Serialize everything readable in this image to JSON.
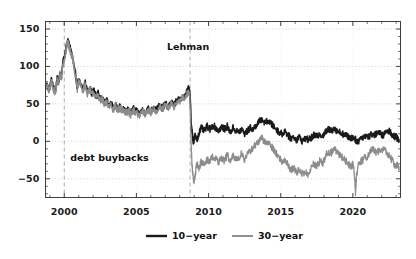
{
  "chart_data": {
    "type": "line",
    "title": "",
    "xlabel": "",
    "ylabel": "",
    "xlim": [
      1998.7,
      2023.3
    ],
    "ylim": [
      -75,
      160
    ],
    "grid": true,
    "grid_style": "dotted",
    "legend_position": "bottom-center",
    "xticks": [
      2000,
      2005,
      2010,
      2015,
      2020
    ],
    "xtick_labels": [
      "2000",
      "2005",
      "2010",
      "2015",
      "2020"
    ],
    "yticks": [
      -50,
      0,
      50,
      100,
      150
    ],
    "ytick_labels": [
      "−50",
      "0",
      "50",
      "100",
      "150"
    ],
    "annotations": [
      {
        "text": "Lehman",
        "x": 2008.72,
        "y": 132,
        "vline": true
      },
      {
        "text": "debt buybacks",
        "x": 2000.0,
        "y": -22,
        "vline": true
      }
    ],
    "series": [
      {
        "name": "10−year",
        "color": "#1a1a1a",
        "width": 1.6,
        "x": [
          1998.8,
          1998.95,
          1999.1,
          1999.25,
          1999.4,
          1999.5,
          1999.6,
          1999.7,
          1999.8,
          1999.9,
          2000.0,
          2000.08,
          2000.16,
          2000.24,
          2000.32,
          2000.4,
          2000.5,
          2000.6,
          2000.7,
          2000.8,
          2000.9,
          2001.0,
          2001.15,
          2001.3,
          2001.45,
          2001.6,
          2001.75,
          2001.9,
          2002.05,
          2002.2,
          2002.35,
          2002.5,
          2002.65,
          2002.8,
          2002.95,
          2003.1,
          2003.25,
          2003.4,
          2003.55,
          2003.7,
          2003.85,
          2004.0,
          2004.2,
          2004.4,
          2004.6,
          2004.8,
          2005.0,
          2005.2,
          2005.4,
          2005.6,
          2005.8,
          2006.0,
          2006.2,
          2006.4,
          2006.6,
          2006.8,
          2007.0,
          2007.2,
          2007.4,
          2007.6,
          2007.8,
          2008.0,
          2008.15,
          2008.3,
          2008.45,
          2008.6,
          2008.7,
          2008.75,
          2008.8,
          2008.88,
          2008.95,
          2009.05,
          2009.2,
          2009.35,
          2009.5,
          2009.7,
          2009.9,
          2010.1,
          2010.3,
          2010.5,
          2010.7,
          2010.9,
          2011.1,
          2011.3,
          2011.5,
          2011.7,
          2011.9,
          2012.1,
          2012.3,
          2012.5,
          2012.7,
          2012.9,
          2013.1,
          2013.3,
          2013.5,
          2013.7,
          2013.9,
          2014.1,
          2014.3,
          2014.5,
          2014.7,
          2014.9,
          2015.1,
          2015.3,
          2015.5,
          2015.7,
          2015.9,
          2016.1,
          2016.3,
          2016.5,
          2016.7,
          2016.9,
          2017.1,
          2017.3,
          2017.5,
          2017.7,
          2017.9,
          2018.1,
          2018.3,
          2018.5,
          2018.7,
          2018.9,
          2019.1,
          2019.3,
          2019.5,
          2019.7,
          2019.9,
          2020.05,
          2020.2,
          2020.3,
          2020.5,
          2020.7,
          2020.9,
          2021.1,
          2021.3,
          2021.5,
          2021.7,
          2021.9,
          2022.1,
          2022.3,
          2022.5,
          2022.7,
          2022.9,
          2023.0,
          2023.1,
          2023.2
        ],
        "y": [
          76,
          68,
          82,
          72,
          66,
          84,
          78,
          92,
          86,
          104,
          112,
          120,
          128,
          134,
          130,
          124,
          118,
          110,
          96,
          88,
          72,
          82,
          76,
          70,
          78,
          66,
          72,
          64,
          68,
          60,
          64,
          56,
          58,
          50,
          54,
          48,
          52,
          44,
          50,
          42,
          46,
          44,
          40,
          42,
          38,
          44,
          40,
          36,
          42,
          38,
          44,
          40,
          46,
          42,
          48,
          44,
          50,
          46,
          52,
          48,
          56,
          54,
          60,
          58,
          64,
          70,
          66,
          50,
          20,
          10,
          -4,
          8,
          2,
          12,
          18,
          14,
          20,
          16,
          22,
          18,
          14,
          20,
          16,
          20,
          12,
          18,
          14,
          12,
          16,
          10,
          14,
          18,
          16,
          22,
          26,
          30,
          24,
          28,
          24,
          20,
          16,
          12,
          10,
          14,
          8,
          4,
          6,
          2,
          6,
          0,
          4,
          2,
          4,
          8,
          6,
          10,
          8,
          12,
          16,
          14,
          18,
          14,
          12,
          10,
          8,
          6,
          4,
          6,
          2,
          -2,
          4,
          6,
          8,
          6,
          10,
          8,
          12,
          10,
          8,
          12,
          14,
          10,
          6,
          8,
          4,
          2
        ]
      },
      {
        "name": "30−year",
        "color": "#8c8c8c",
        "width": 1.3,
        "x": [
          1998.8,
          1998.95,
          1999.1,
          1999.25,
          1999.4,
          1999.5,
          1999.6,
          1999.7,
          1999.8,
          1999.9,
          2000.0,
          2000.08,
          2000.16,
          2000.24,
          2000.32,
          2000.4,
          2000.5,
          2000.6,
          2000.7,
          2000.8,
          2000.9,
          2001.0,
          2001.15,
          2001.3,
          2001.45,
          2001.6,
          2001.75,
          2001.9,
          2002.05,
          2002.2,
          2002.35,
          2002.5,
          2002.65,
          2002.8,
          2002.95,
          2003.1,
          2003.25,
          2003.4,
          2003.55,
          2003.7,
          2003.85,
          2004.0,
          2004.2,
          2004.4,
          2004.6,
          2004.8,
          2005.0,
          2005.2,
          2005.4,
          2005.6,
          2005.8,
          2006.0,
          2006.2,
          2006.4,
          2006.6,
          2006.8,
          2007.0,
          2007.2,
          2007.4,
          2007.6,
          2007.8,
          2008.0,
          2008.15,
          2008.3,
          2008.45,
          2008.6,
          2008.7,
          2008.75,
          2008.8,
          2008.85,
          2008.92,
          2009.0,
          2009.1,
          2009.2,
          2009.35,
          2009.5,
          2009.7,
          2009.9,
          2010.1,
          2010.3,
          2010.5,
          2010.7,
          2010.9,
          2011.1,
          2011.3,
          2011.5,
          2011.7,
          2011.9,
          2012.1,
          2012.3,
          2012.5,
          2012.7,
          2012.9,
          2013.1,
          2013.3,
          2013.5,
          2013.7,
          2013.9,
          2014.1,
          2014.3,
          2014.5,
          2014.7,
          2014.9,
          2015.1,
          2015.3,
          2015.5,
          2015.7,
          2015.9,
          2016.1,
          2016.3,
          2016.5,
          2016.7,
          2016.9,
          2017.1,
          2017.3,
          2017.5,
          2017.7,
          2017.9,
          2018.1,
          2018.3,
          2018.5,
          2018.7,
          2018.9,
          2019.1,
          2019.3,
          2019.5,
          2019.7,
          2019.9,
          2020.0,
          2020.1,
          2020.18,
          2020.25,
          2020.4,
          2020.6,
          2020.8,
          2021.0,
          2021.2,
          2021.4,
          2021.6,
          2021.8,
          2022.0,
          2022.2,
          2022.4,
          2022.6,
          2022.8,
          2023.0,
          2023.1,
          2023.2
        ],
        "y": [
          74,
          66,
          80,
          70,
          64,
          82,
          76,
          90,
          84,
          102,
          110,
          118,
          126,
          132,
          128,
          122,
          116,
          108,
          94,
          86,
          70,
          80,
          74,
          68,
          76,
          64,
          70,
          62,
          66,
          58,
          62,
          54,
          56,
          48,
          52,
          46,
          50,
          42,
          48,
          40,
          44,
          42,
          38,
          40,
          36,
          42,
          38,
          34,
          40,
          36,
          42,
          38,
          44,
          40,
          46,
          42,
          48,
          44,
          50,
          46,
          54,
          52,
          58,
          56,
          62,
          66,
          60,
          30,
          -10,
          -30,
          -48,
          -54,
          -40,
          -30,
          -36,
          -26,
          -32,
          -24,
          -26,
          -20,
          -24,
          -28,
          -22,
          -26,
          -18,
          -28,
          -20,
          -24,
          -22,
          -16,
          -24,
          -18,
          -12,
          -8,
          -4,
          0,
          4,
          -2,
          0,
          -6,
          -10,
          -16,
          -22,
          -28,
          -24,
          -32,
          -38,
          -36,
          -42,
          -38,
          -44,
          -40,
          -46,
          -36,
          -30,
          -34,
          -26,
          -30,
          -20,
          -14,
          -16,
          -10,
          -14,
          -18,
          -22,
          -26,
          -30,
          -34,
          -30,
          -40,
          -68,
          -46,
          -32,
          -26,
          -22,
          -20,
          -14,
          -10,
          -16,
          -12,
          -14,
          -10,
          -16,
          -22,
          -28,
          -34,
          -30,
          -38
        ]
      }
    ]
  },
  "legend": {
    "items": [
      {
        "label": "10−year",
        "color": "#1a1a1a"
      },
      {
        "label": "30−year",
        "color": "#8c8c8c"
      }
    ]
  },
  "axis": {
    "x_labels": [
      "2000",
      "2005",
      "2010",
      "2015",
      "2020"
    ],
    "y_labels": [
      "150",
      "100",
      "50",
      "0",
      "−50"
    ]
  },
  "annotations": {
    "lehman": "Lehman",
    "debt_buybacks": "debt buybacks"
  }
}
